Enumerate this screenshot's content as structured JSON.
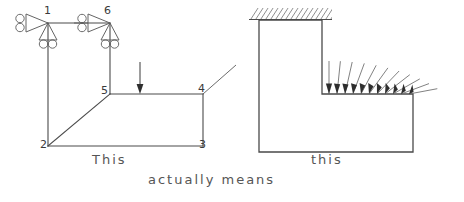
{
  "figure": {
    "captions": {
      "left": "This",
      "middle": "actually means",
      "right": "this"
    },
    "colors": {
      "line": "#4a4a4a",
      "support": "#5c5c5c",
      "arrow": "#2e2e2e",
      "hatch": "#7c7c7c",
      "text": "#555555",
      "background": "#ffffff"
    }
  },
  "left_diagram": {
    "name": "idealized-frame-model",
    "node_labels": [
      {
        "id": "1",
        "text": "1",
        "x": 44,
        "y": 14
      },
      {
        "id": "6",
        "text": "6",
        "x": 104,
        "y": 14
      },
      {
        "id": "5",
        "text": "5",
        "x": 101,
        "y": 94
      },
      {
        "id": "4",
        "text": "4",
        "x": 198,
        "y": 92
      },
      {
        "id": "2",
        "text": "2",
        "x": 40,
        "y": 148
      },
      {
        "id": "3",
        "text": "3",
        "x": 199,
        "y": 148
      }
    ],
    "members": [
      {
        "from": "1",
        "to": "6",
        "kind": "top-chord"
      },
      {
        "from": "1",
        "to": "2",
        "kind": "left-column"
      },
      {
        "from": "6",
        "to": "5",
        "kind": "inner-column"
      },
      {
        "from": "5",
        "to": "4",
        "kind": "mid-beam"
      },
      {
        "from": "4",
        "to": "3",
        "kind": "right-column"
      },
      {
        "from": "2",
        "to": "3",
        "kind": "bottom-chord"
      },
      {
        "from": "2",
        "to": "5",
        "kind": "diagonal-brace"
      }
    ],
    "supports": [
      {
        "at_node": "1",
        "type": "roller-horizontal",
        "direction": "left"
      },
      {
        "at_node": "1",
        "type": "roller-vertical",
        "direction": "down"
      },
      {
        "at_node": "6",
        "type": "roller-horizontal",
        "direction": "left"
      },
      {
        "at_node": "6",
        "type": "roller-vertical",
        "direction": "down"
      }
    ],
    "loads": [
      {
        "type": "point-load",
        "direction": "down",
        "x": 140,
        "y_from": 62,
        "y_to": 94
      }
    ],
    "annotations": [
      {
        "type": "leader-line",
        "at_node": "4",
        "direction": "up-right"
      }
    ]
  },
  "right_diagram": {
    "name": "physical-interpretation",
    "fixed_support": {
      "type": "hatched-fixed-boundary",
      "position": "top",
      "x": 249,
      "y": 8,
      "width": 83,
      "height": 12
    },
    "body_outline": [
      {
        "x": 259,
        "y": 20
      },
      {
        "x": 322,
        "y": 20
      },
      {
        "x": 322,
        "y": 94
      },
      {
        "x": 413,
        "y": 94
      },
      {
        "x": 413,
        "y": 152
      },
      {
        "x": 259,
        "y": 152
      }
    ],
    "distributed_load": {
      "type": "fan-of-arrows",
      "count": 11,
      "base_y": 94,
      "base_x_start": 327,
      "base_x_end": 410,
      "angle_start_deg": 0,
      "angle_end_deg": 62,
      "note": "arrows rotate progressively from vertical at left to strongly inclined at right"
    }
  }
}
